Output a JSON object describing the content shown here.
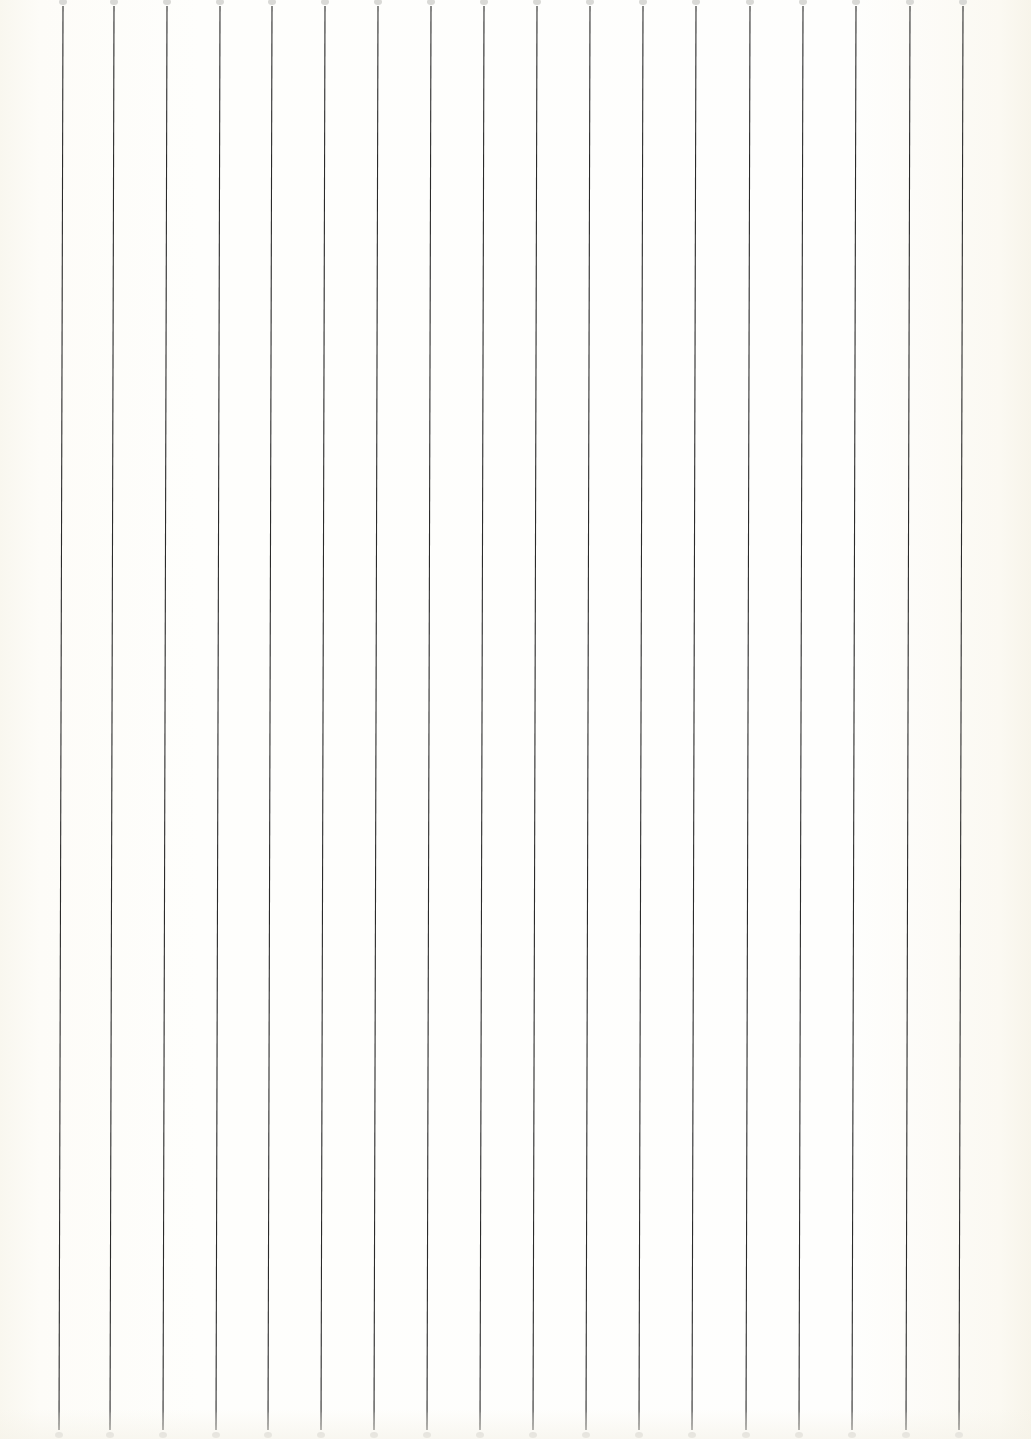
{
  "document": {
    "type": "ruled-paper",
    "orientation": "vertical-lines",
    "background_color": "#fefefc",
    "line_color": "#2b2b2b",
    "endpoint_dot_color": "#d9d9d6",
    "line_count": 18,
    "line_spacing_px": 53,
    "line_top_y": 6,
    "line_bottom_y": 1430,
    "bottom_offset_px": -4,
    "lines_top_x": [
      63,
      114,
      167,
      220,
      272,
      325,
      378,
      431,
      484,
      537,
      590,
      643,
      696,
      750,
      803,
      856,
      910,
      963
    ]
  }
}
